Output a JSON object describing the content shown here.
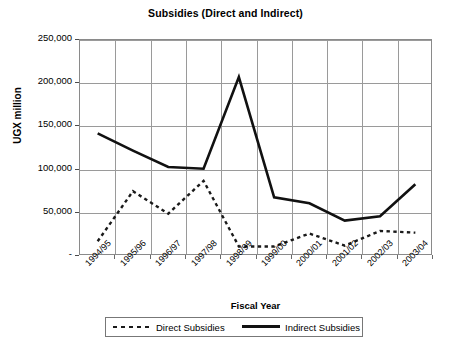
{
  "chart_data": {
    "type": "line",
    "title": "Subsidies (Direct and Indirect)",
    "xlabel": "Fiscal Year",
    "ylabel": "UGX million",
    "categories": [
      "1994/95",
      "1995/96",
      "1996/97",
      "1997/98",
      "1998/99",
      "1999/00",
      "2000/01",
      "2001/02",
      "2002/03",
      "2003/04"
    ],
    "ylim": [
      0,
      250000
    ],
    "ytick_labels": [
      "250,000",
      "200,000",
      "150,000",
      "100,000",
      "50,000",
      "-"
    ],
    "ytick_values": [
      250000,
      200000,
      150000,
      100000,
      50000,
      0
    ],
    "grid": true,
    "legend_position": "below-axis",
    "series": [
      {
        "name": "Direct Subsidies",
        "style": "dashed",
        "color": "#1a1a1a",
        "values": [
          17000,
          75000,
          49000,
          87000,
          11000,
          11000,
          26000,
          12000,
          29000,
          27000
        ]
      },
      {
        "name": "Indirect Subsidies",
        "style": "solid",
        "color": "#111111",
        "values": [
          142000,
          122000,
          103000,
          101000,
          207000,
          68000,
          61000,
          41000,
          46000,
          83000
        ]
      }
    ]
  },
  "legend": {
    "items": [
      {
        "label": "Direct Subsidies",
        "marker": "dashed-line-swatch"
      },
      {
        "label": "Indirect Subsidies",
        "marker": "solid-line-swatch"
      }
    ]
  },
  "caption": {
    "text": ""
  }
}
